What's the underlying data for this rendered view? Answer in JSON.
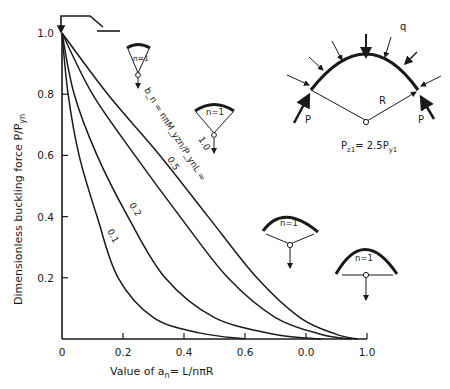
{
  "chart_data": {
    "type": "line",
    "title": "",
    "xlabel": "Value of a_n = L/nπR",
    "xlabel_parts": {
      "prefix": "Value of ",
      "var": "a",
      "sub": "n",
      "suffix": "= L/nπR"
    },
    "ylabel": "Dimensionless buckling force P/P_yn",
    "ylabel_parts": {
      "prefix": "Dimensionless buckling force ",
      "main": "P/P",
      "sub": "yn"
    },
    "xlim": [
      0,
      1.0
    ],
    "ylim": [
      0,
      1.0
    ],
    "x_ticks": [
      "0",
      "0.2",
      "0.4",
      "0.6",
      "0.0",
      "1.0"
    ],
    "x_tick_values": [
      0,
      0.2,
      0.4,
      0.6,
      0.8,
      1.0
    ],
    "y_ticks": [
      "0.2",
      "0.4",
      "0.6",
      "0.8",
      "1.0"
    ],
    "y_tick_values": [
      0.2,
      0.4,
      0.6,
      0.8,
      1.0
    ],
    "grid": false,
    "legend": "inline curve labels",
    "parameter_label": "b_n = nπM_yzn/P_ynL =",
    "series": [
      {
        "name": "0.1",
        "points": [
          [
            0,
            1.0
          ],
          [
            0.02,
            0.8
          ],
          [
            0.056,
            0.6
          ],
          [
            0.115,
            0.4
          ],
          [
            0.184,
            0.2
          ],
          [
            0.3,
            0.07
          ],
          [
            0.45,
            0.02
          ],
          [
            0.6,
            0.0
          ]
        ]
      },
      {
        "name": "0.2",
        "points": [
          [
            0,
            1.0
          ],
          [
            0.04,
            0.8
          ],
          [
            0.115,
            0.6
          ],
          [
            0.216,
            0.4
          ],
          [
            0.338,
            0.2
          ],
          [
            0.5,
            0.07
          ],
          [
            0.7,
            0.015
          ],
          [
            0.85,
            0.0
          ]
        ]
      },
      {
        "name": "0.5",
        "points": [
          [
            0,
            1.0
          ],
          [
            0.1,
            0.8
          ],
          [
            0.239,
            0.6
          ],
          [
            0.387,
            0.4
          ],
          [
            0.544,
            0.2
          ],
          [
            0.7,
            0.07
          ],
          [
            0.85,
            0.015
          ],
          [
            0.95,
            0.0
          ]
        ]
      },
      {
        "name": "1.0",
        "points": [
          [
            0,
            1.0
          ],
          [
            0.15,
            0.8
          ],
          [
            0.321,
            0.6
          ],
          [
            0.479,
            0.4
          ],
          [
            0.639,
            0.2
          ],
          [
            0.78,
            0.07
          ],
          [
            0.9,
            0.015
          ],
          [
            0.97,
            0.0
          ]
        ]
      }
    ],
    "annotations": {
      "curve_labels": [
        "0.1",
        "0.2",
        "0.5",
        "1.0"
      ],
      "mode_labels": [
        "n=1",
        "n=1",
        "n=1",
        "n=1"
      ],
      "arch_diagram": {
        "load": "q",
        "end_force": "P",
        "radius": "R",
        "formula_main": "P",
        "formula_sub1": "z1",
        "formula_mid": "= 2.5P",
        "formula_sub2": "y1"
      }
    }
  }
}
